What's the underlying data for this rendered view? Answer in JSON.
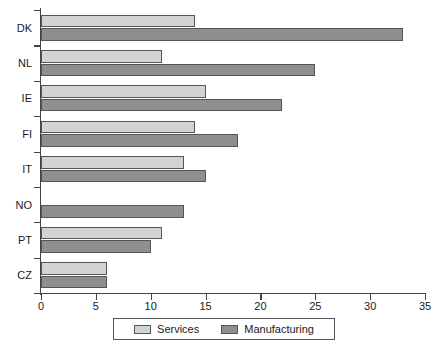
{
  "chart_data": {
    "type": "bar",
    "orientation": "horizontal",
    "title": "",
    "subtitle": "",
    "xlabel": "",
    "ylabel": "",
    "xlim": [
      0,
      35
    ],
    "xticks": [
      0,
      5,
      10,
      15,
      20,
      25,
      30,
      35
    ],
    "grid": false,
    "legend_position": "bottom",
    "categories": [
      "DK",
      "NL",
      "IE",
      "FI",
      "IT",
      "NO",
      "PT",
      "CZ"
    ],
    "series": [
      {
        "name": "Services",
        "color": "#d3d3d3",
        "values": [
          14,
          11,
          15,
          14,
          13,
          null,
          11,
          6
        ]
      },
      {
        "name": "Manufacturing",
        "color": "#8f8f8f",
        "values": [
          33,
          25,
          22,
          18,
          15,
          13,
          10,
          6
        ]
      }
    ]
  },
  "legend": {
    "entries": [
      {
        "label": "Services",
        "color": "#d3d3d3"
      },
      {
        "label": "Manufacturing",
        "color": "#8f8f8f"
      }
    ]
  },
  "axis": {
    "x_tick_labels": [
      "0",
      "5",
      "10",
      "15",
      "20",
      "25",
      "30",
      "35"
    ],
    "y_tick_labels": [
      "DK",
      "NL",
      "IE",
      "FI",
      "IT",
      "NO",
      "PT",
      "CZ"
    ]
  },
  "colors": {
    "services": "#d3d3d3",
    "manufacturing": "#8f8f8f",
    "axis": "#444444",
    "bar_outline": "#555555",
    "text": "#1a1a1a",
    "background": "#ffffff"
  }
}
